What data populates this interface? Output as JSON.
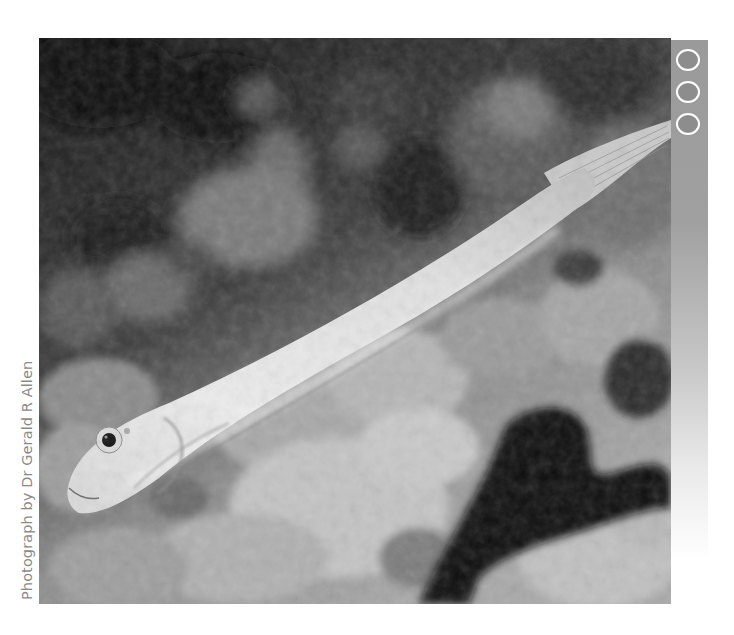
{
  "photo": {
    "subject": "Pale elongated fish swimming diagonally over coral reef",
    "tone": "grayscale",
    "alt": "Fish over reef"
  },
  "credit": {
    "text": "Photograph by Dr Gerald R Allen"
  },
  "side_bar": {
    "icons": [
      {
        "name": "circle-icon"
      },
      {
        "name": "circle-icon"
      },
      {
        "name": "circle-icon"
      }
    ],
    "colors": {
      "bar": "#9a9a9a",
      "ring": "#ffffff",
      "ring_fill": "#8d8d8d"
    }
  },
  "colors": {
    "background": "#ffffff",
    "credit_text": "#8a8a8a"
  }
}
